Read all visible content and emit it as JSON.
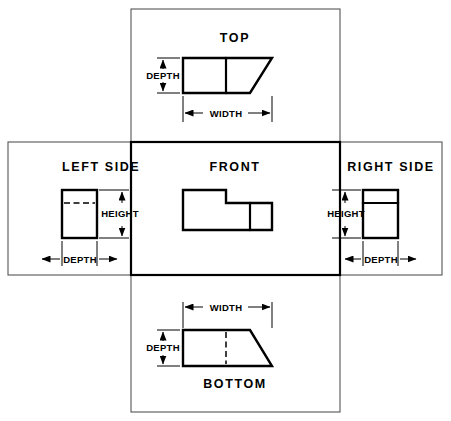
{
  "drawing": {
    "title": "Six principal orthographic views layout",
    "stroke_color": "#000000",
    "frame_color": "#555555",
    "background": "#ffffff"
  },
  "views": {
    "top": {
      "label": "TOP",
      "dimensions": [
        {
          "name": "depth-dimension",
          "label": "DEPTH",
          "orientation": "vertical"
        },
        {
          "name": "width-dimension",
          "label": "WIDTH",
          "orientation": "horizontal"
        }
      ]
    },
    "left_side": {
      "label": "LEFT SIDE",
      "dimensions": [
        {
          "name": "height-dimension",
          "label": "HEIGHT",
          "orientation": "vertical"
        },
        {
          "name": "depth-dimension",
          "label": "DEPTH",
          "orientation": "horizontal"
        }
      ]
    },
    "front": {
      "label": "FRONT",
      "dimensions": []
    },
    "right_side": {
      "label": "RIGHT SIDE",
      "dimensions": [
        {
          "name": "height-dimension",
          "label": "HEIGHT",
          "orientation": "vertical"
        },
        {
          "name": "depth-dimension",
          "label": "DEPTH",
          "orientation": "horizontal"
        }
      ]
    },
    "bottom": {
      "label": "BOTTOM",
      "dimensions": [
        {
          "name": "width-dimension",
          "label": "WIDTH",
          "orientation": "horizontal"
        },
        {
          "name": "depth-dimension",
          "label": "DEPTH",
          "orientation": "vertical"
        }
      ]
    }
  },
  "labels": {
    "top": "TOP",
    "left_side": "LEFT SIDE",
    "front": "FRONT",
    "right_side": "RIGHT SIDE",
    "bottom": "BOTTOM",
    "depth": "DEPTH",
    "width": "WIDTH",
    "height": "HEIGHT"
  }
}
